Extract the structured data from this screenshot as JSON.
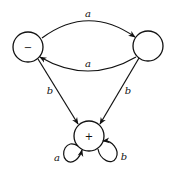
{
  "diagram": {
    "type": "state-machine",
    "nodes": [
      {
        "id": "minus",
        "label": "−"
      },
      {
        "id": "right",
        "label": ""
      },
      {
        "id": "plus",
        "label": "+"
      }
    ],
    "edges": [
      {
        "from": "minus",
        "to": "right",
        "label": "a"
      },
      {
        "from": "right",
        "to": "minus",
        "label": "a"
      },
      {
        "from": "minus",
        "to": "plus",
        "label": "b"
      },
      {
        "from": "right",
        "to": "plus",
        "label": "b"
      },
      {
        "from": "plus",
        "to": "plus",
        "label": "a"
      },
      {
        "from": "plus",
        "to": "plus",
        "label": "b"
      }
    ]
  }
}
